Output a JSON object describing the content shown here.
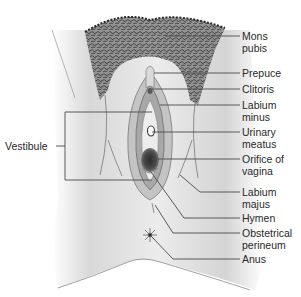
{
  "diagram": {
    "title": "",
    "left_labels": [
      {
        "id": "vestibule",
        "text": "Vestibule"
      }
    ],
    "right_labels": [
      {
        "id": "mons-pubis",
        "text": "Mons\npubis"
      },
      {
        "id": "prepuce",
        "text": "Prepuce"
      },
      {
        "id": "clitoris",
        "text": "Clitoris"
      },
      {
        "id": "labium-minus",
        "text": "Labium\nminus"
      },
      {
        "id": "urinary-meatus",
        "text": "Urinary\nmeatus"
      },
      {
        "id": "orifice-of-vagina",
        "text": "Orifice of\nvagina"
      },
      {
        "id": "labium-majus",
        "text": "Labium\nmajus"
      },
      {
        "id": "hymen",
        "text": "Hymen"
      },
      {
        "id": "obstetrical-perineum",
        "text": "Obstetrical\nperineum"
      },
      {
        "id": "anus",
        "text": "Anus"
      }
    ],
    "colors": {
      "line": "#4a4a4a",
      "skin_light": "#e6e6e6",
      "skin_dark": "#9a9a9a",
      "hair": "#3a3a3a",
      "orifice": "#3c3c3c"
    }
  }
}
